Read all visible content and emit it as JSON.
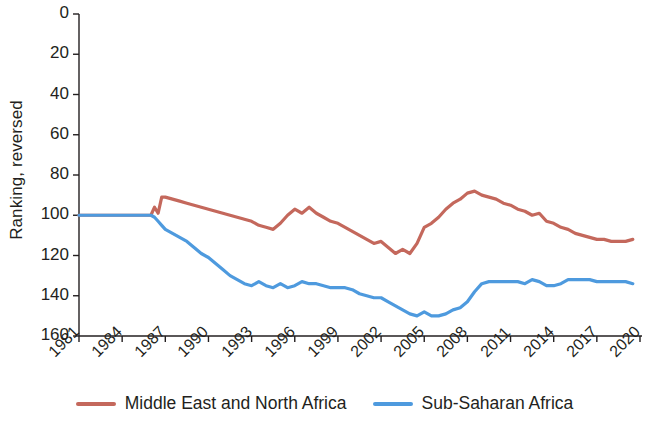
{
  "chart_data": {
    "type": "line",
    "title": "",
    "xlabel": "",
    "ylabel": "Ranking, reversed",
    "y_axis_reversed": true,
    "ylim": [
      0,
      160
    ],
    "yticks": [
      0,
      20,
      40,
      60,
      80,
      100,
      120,
      140,
      160
    ],
    "ytick_labels": [
      "0",
      "20",
      "40",
      "60",
      "80",
      "100",
      "120",
      "140",
      "160"
    ],
    "xlim": [
      1981,
      2020
    ],
    "xticks": [
      1981,
      1984,
      1987,
      1990,
      1993,
      1996,
      1999,
      2002,
      2005,
      2008,
      2011,
      2014,
      2017,
      2020
    ],
    "xtick_labels": [
      "1981",
      "1984",
      "1987",
      "1990",
      "1993",
      "1996",
      "1999",
      "2002",
      "2005",
      "2008",
      "2011",
      "2014",
      "2017",
      "2020"
    ],
    "grid": false,
    "legend_position": "bottom-center",
    "x": [
      1981,
      1981.5,
      1982,
      1982.5,
      1983,
      1983.5,
      1984,
      1984.5,
      1985,
      1985.5,
      1986,
      1986.25,
      1986.5,
      1986.75,
      1987,
      1987.5,
      1988,
      1988.5,
      1989,
      1989.5,
      1990,
      1990.5,
      1991,
      1991.5,
      1992,
      1992.5,
      1993,
      1993.5,
      1994,
      1994.5,
      1995,
      1995.5,
      1996,
      1996.5,
      1997,
      1997.5,
      1998,
      1998.5,
      1999,
      1999.5,
      2000,
      2000.5,
      2001,
      2001.5,
      2002,
      2002.5,
      2003,
      2003.5,
      2004,
      2004.5,
      2005,
      2005.5,
      2006,
      2006.5,
      2007,
      2007.5,
      2008,
      2008.5,
      2009,
      2009.5,
      2010,
      2010.5,
      2011,
      2011.5,
      2012,
      2012.5,
      2013,
      2013.5,
      2014,
      2014.5,
      2015,
      2015.5,
      2016,
      2016.5,
      2017,
      2017.5,
      2018,
      2018.5,
      2019,
      2019.5
    ],
    "series": [
      {
        "name": "Middle East and North Africa",
        "color": "#c4685c",
        "values": [
          100,
          100,
          100,
          100,
          100,
          100,
          100,
          100,
          100,
          100,
          100,
          96,
          99,
          91,
          91,
          92,
          93,
          94,
          95,
          96,
          97,
          98,
          99,
          100,
          101,
          102,
          103,
          105,
          106,
          107,
          104,
          100,
          97,
          99,
          96,
          99,
          101,
          103,
          104,
          106,
          108,
          110,
          112,
          114,
          113,
          116,
          119,
          117,
          119,
          114,
          106,
          104,
          101,
          97,
          94,
          92,
          89,
          88,
          90,
          91,
          92,
          94,
          95,
          97,
          98,
          100,
          99,
          103,
          104,
          106,
          107,
          109,
          110,
          111,
          112,
          112,
          113,
          113,
          113,
          112
        ]
      },
      {
        "name": "Sub-Saharan Africa",
        "color": "#4e9ade",
        "values": [
          100,
          100,
          100,
          100,
          100,
          100,
          100,
          100,
          100,
          100,
          100,
          101,
          103,
          105,
          107,
          109,
          111,
          113,
          116,
          119,
          121,
          124,
          127,
          130,
          132,
          134,
          135,
          133,
          135,
          136,
          134,
          136,
          135,
          133,
          134,
          134,
          135,
          136,
          136,
          136,
          137,
          139,
          140,
          141,
          141,
          143,
          145,
          147,
          149,
          150,
          148,
          150,
          150,
          149,
          147,
          146,
          143,
          138,
          134,
          133,
          133,
          133,
          133,
          133,
          134,
          132,
          133,
          135,
          135,
          134,
          132,
          132,
          132,
          132,
          133,
          133,
          133,
          133,
          133,
          134
        ]
      }
    ]
  },
  "legend": {
    "items": [
      {
        "label": "Middle East and North Africa",
        "color": "#c4685c"
      },
      {
        "label": "Sub-Saharan Africa",
        "color": "#4e9ade"
      }
    ]
  }
}
